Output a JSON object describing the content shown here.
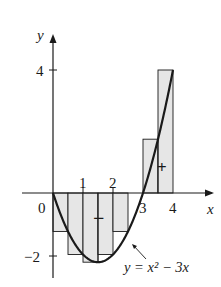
{
  "figure": {
    "function_label": "y = x² − 3x",
    "axis_x_label": "x",
    "axis_y_label": "y",
    "origin_label": "0",
    "x_ticks_above": [
      "1",
      "2"
    ],
    "x_ticks_below": [
      "3",
      "4"
    ],
    "y_ticks": [
      "4",
      "−2"
    ],
    "sign_negative": "−",
    "sign_positive": "+",
    "colors": {
      "rect_fill": "#e6e6e6",
      "stroke": "#1a1a1a"
    }
  },
  "chart_data": {
    "type": "bar",
    "title": "",
    "xlabel": "x",
    "ylabel": "y",
    "function": "y = x^2 - 3x",
    "interval": [
      0,
      4
    ],
    "n": 8,
    "dx": 0.5,
    "sample": "right endpoints",
    "rect_left_edges": [
      0,
      0.5,
      1,
      1.5,
      2,
      2.5,
      3,
      3.5
    ],
    "values": [
      -1.25,
      -2,
      -2.25,
      -2,
      -1.25,
      0,
      1.75,
      4
    ],
    "xlim": [
      -0.3,
      4.3
    ],
    "ylim": [
      -2.6,
      4.6
    ],
    "annotations": [
      "−",
      "+",
      "y = x² − 3x"
    ]
  }
}
